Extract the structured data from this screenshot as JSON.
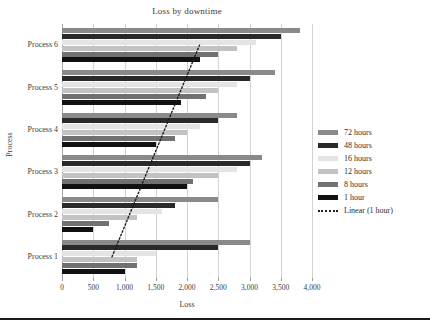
{
  "chart_data": {
    "type": "bar",
    "orientation": "horizontal",
    "title": "Loss by downtime",
    "xlabel": "Loss",
    "ylabel": "Process",
    "categories": [
      "Process 1",
      "Process 2",
      "Process 3",
      "Process 4",
      "Process 5",
      "Process 6"
    ],
    "xlim": [
      0,
      4000
    ],
    "xticks": [
      0,
      500,
      1000,
      1500,
      2000,
      2500,
      3000,
      3500,
      4000
    ],
    "xtick_labels": [
      "0",
      "500",
      "1,000",
      "1,500",
      "2,000",
      "2,500",
      "3,000",
      "3,500",
      "4,000"
    ],
    "grid": true,
    "legend_position": "right",
    "series": [
      {
        "name": "72 hours",
        "color": "#8a8a8a",
        "values": [
          3000,
          2500,
          3200,
          2800,
          3400,
          3800
        ]
      },
      {
        "name": "48 hours",
        "color": "#2a2a2a",
        "values": [
          2500,
          1800,
          3000,
          2500,
          3000,
          3500
        ]
      },
      {
        "name": "16 hours",
        "color": "#e4e4e4",
        "values": [
          1500,
          1600,
          2800,
          2200,
          2800,
          3100
        ]
      },
      {
        "name": "12 hours",
        "color": "#c2c2c2",
        "values": [
          1200,
          1200,
          2500,
          2000,
          2500,
          2800
        ]
      },
      {
        "name": "8 hours",
        "color": "#717171",
        "values": [
          1200,
          750,
          2100,
          1800,
          2300,
          2500
        ]
      },
      {
        "name": "1 hour",
        "color": "#111111",
        "values": [
          1000,
          500,
          2000,
          1500,
          1900,
          2200
        ]
      }
    ],
    "trendline": {
      "name": "Linear (1 hour)",
      "style": "dotted",
      "color": "#1c1c1c",
      "start": {
        "category": "Process 1",
        "value": 800
      },
      "end": {
        "category": "Process 6",
        "value": 2200
      }
    }
  },
  "legend": {
    "items": [
      {
        "label": "72 hours",
        "swatch": "bar"
      },
      {
        "label": "48 hours",
        "swatch": "bar"
      },
      {
        "label": "16 hours",
        "swatch": "bar"
      },
      {
        "label": "12 hours",
        "swatch": "bar"
      },
      {
        "label": "8 hours",
        "swatch": "bar"
      },
      {
        "label": "1 hour",
        "swatch": "bar"
      },
      {
        "label": "Linear (1 hour)",
        "swatch": "dotted-line"
      }
    ]
  }
}
